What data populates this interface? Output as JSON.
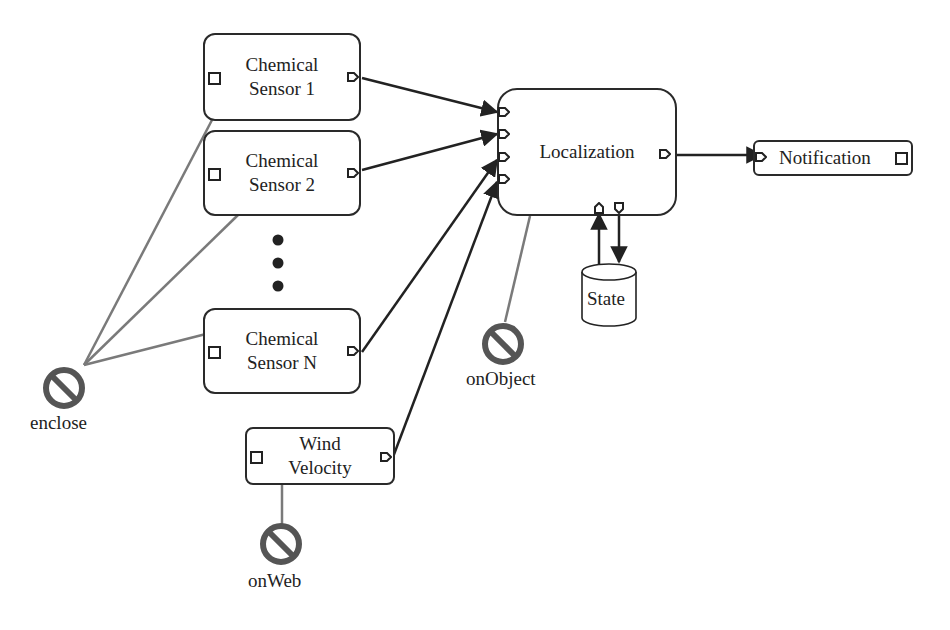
{
  "diagram": {
    "nodes": [
      {
        "id": "cs1",
        "label": "Chemical\nSensor 1"
      },
      {
        "id": "cs2",
        "label": "Chemical\nSensor 2"
      },
      {
        "id": "csn",
        "label": "Chemical\nSensor N"
      },
      {
        "id": "wind",
        "label": "Wind\nVelocity"
      },
      {
        "id": "loc",
        "label": "Localization"
      },
      {
        "id": "notif",
        "label": "Notification"
      },
      {
        "id": "state",
        "label": "State"
      }
    ],
    "constraints": [
      {
        "id": "enclose",
        "label": "enclose",
        "icon": "prohibited-icon"
      },
      {
        "id": "onObject",
        "label": "onObject",
        "icon": "prohibited-icon"
      },
      {
        "id": "onWeb",
        "label": "onWeb",
        "icon": "prohibited-icon"
      }
    ],
    "ellipsis": "vertical-dots",
    "colors": {
      "stroke": "#2a2a2a",
      "constraint_line": "#7a7a7a",
      "constraint_icon": "#5a5a5a"
    }
  }
}
